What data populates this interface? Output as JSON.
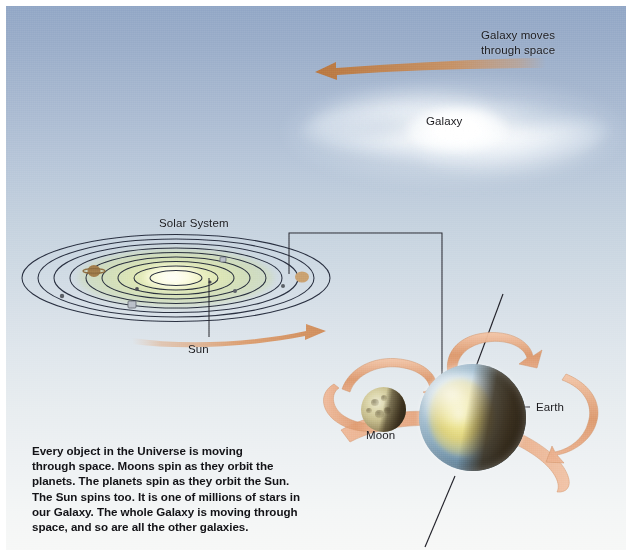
{
  "page": {
    "title": "Every object in the Universe is moving through space",
    "width": 634,
    "height": 556,
    "background_top_color": "#92a7c6",
    "background_bottom_color": "#f7f8f7"
  },
  "labels": {
    "galaxy_moves_line1": "Galaxy moves",
    "galaxy_moves_line2": "through space",
    "galaxy": "Galaxy",
    "solar_system": "Solar System",
    "sun": "Sun",
    "earth": "Earth",
    "moon": "Moon"
  },
  "caption": {
    "line1": "Every object in the Universe is moving",
    "line2": "through space. Moons spin as they orbit the",
    "line3": "planets. The planets spin as they orbit the Sun.",
    "line4": "The Sun spins too. It is one of millions of stars in",
    "line5": "our Galaxy. The whole Galaxy is moving through",
    "line6": "space, and so are all the other galaxies."
  },
  "colors": {
    "arrow_orange": "#d9955f",
    "arrow_orange_light": "#e9b58c",
    "ribbon_salmon": "#e6a37f",
    "leader_line": "#2b2b33",
    "orbit_line": "#1e2230",
    "sun_glow": "#f3f6c8",
    "earth_ocean": "#8fb0c6",
    "earth_night": "#3b2d18",
    "moon_body": "#c6bd8c",
    "text": "#1b1b1f"
  },
  "diagram": {
    "galaxy_motion_arrow": {
      "direction": "left",
      "from_x": 540,
      "from_y": 58,
      "to_x": 315,
      "to_y": 66
    },
    "solar_system_spin_arrow": {
      "direction": "right",
      "from_x": 130,
      "from_y": 331,
      "to_x": 318,
      "to_y": 322
    },
    "leader_lines": [
      {
        "name": "solar-system-to-earth",
        "points": "283,268 283,227 436,227 436,392"
      },
      {
        "name": "sun-leader",
        "points": "203,272 203,331"
      },
      {
        "name": "earth-leader",
        "points": "468,400 525,400"
      },
      {
        "name": "moon-leader",
        "points": "377,399 377,419"
      },
      {
        "name": "earth-axis-upper",
        "points": "496,290 466,368"
      },
      {
        "name": "earth-axis-lower",
        "points": "448,472 418,540"
      }
    ],
    "planet_count": 9,
    "orbit_count": 9
  }
}
